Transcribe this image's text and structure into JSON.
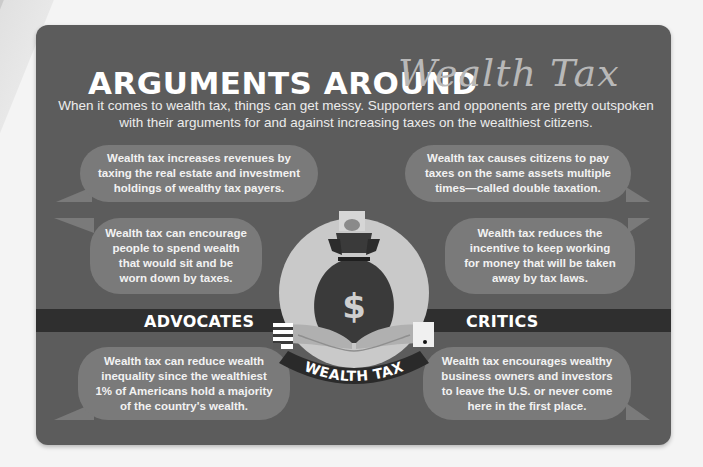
{
  "header": {
    "title_main": "ARGUMENTS AROUND",
    "title_script": "Wealth Tax",
    "subtitle": "When it comes to wealth tax, things can get messy. Supporters and opponents are pretty outspoken with their arguments for and against increasing taxes on the wealthiest citizens."
  },
  "sections": {
    "advocates_label": "ADVOCATES",
    "critics_label": "CRITICS"
  },
  "advocates": [
    {
      "text": "Wealth tax increases revenues by taxing the real estate and investment holdings of wealthy tax payers."
    },
    {
      "text": "Wealth tax can encourage people to spend wealth that would sit and be worn down by taxes."
    },
    {
      "text": "Wealth tax can reduce wealth inequality since the wealthiest 1% of Americans hold a majority of the country's wealth."
    }
  ],
  "critics": [
    {
      "text": "Wealth tax causes citizens to pay taxes on the same assets multiple times—called double taxation."
    },
    {
      "text": "Wealth tax reduces the incentive to keep working for money that will be taken away by tax laws."
    },
    {
      "text": "Wealth tax encourages wealthy business owners and investors to leave the U.S. or never come here in the first place."
    }
  ],
  "illustration": {
    "bag_symbol": "$",
    "banner_text": "WEALTH TAX",
    "icons": [
      "money-bag-icon",
      "dollar-sign-icon",
      "hands-icon",
      "flag-cuff-icon",
      "white-cuff-icon",
      "banknote-icon"
    ]
  },
  "colors": {
    "card_bg": "#5c5c5c",
    "band_bg": "#2f2f2f",
    "bubble_bg": "#7a7a7a",
    "circle_bg": "#c9c9c9",
    "bag_bg": "#3a3a3a",
    "text_light": "#ffffff"
  }
}
